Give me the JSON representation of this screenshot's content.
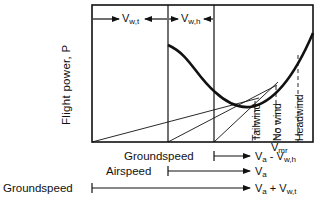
{
  "diagram": {
    "y_axis_label": "Flight power, P",
    "top_arrows": [
      {
        "symbol": "V",
        "subscript": "w,t"
      },
      {
        "symbol": "V",
        "subscript": "w,h"
      }
    ],
    "curve_markers": [
      {
        "label": "Tailwind"
      },
      {
        "label": "No wind"
      },
      {
        "label": "Headwind"
      }
    ],
    "x_marker": {
      "symbol": "V",
      "subscript": "mr"
    },
    "speed_rows": [
      {
        "label": "Groundspeed",
        "end_symbol": "V",
        "end_subscript": "a",
        "end_suffix": " - V",
        "end_suffix_sub": "w,h"
      },
      {
        "label": "Airspeed",
        "end_symbol": "V",
        "end_subscript": "a",
        "end_suffix": "",
        "end_suffix_sub": ""
      },
      {
        "label": "Groundspeed",
        "end_symbol": "V",
        "end_subscript": "a",
        "end_suffix": " + V",
        "end_suffix_sub": "w,t"
      }
    ],
    "colors": {
      "ink": "#111111",
      "background": "#ffffff"
    }
  }
}
